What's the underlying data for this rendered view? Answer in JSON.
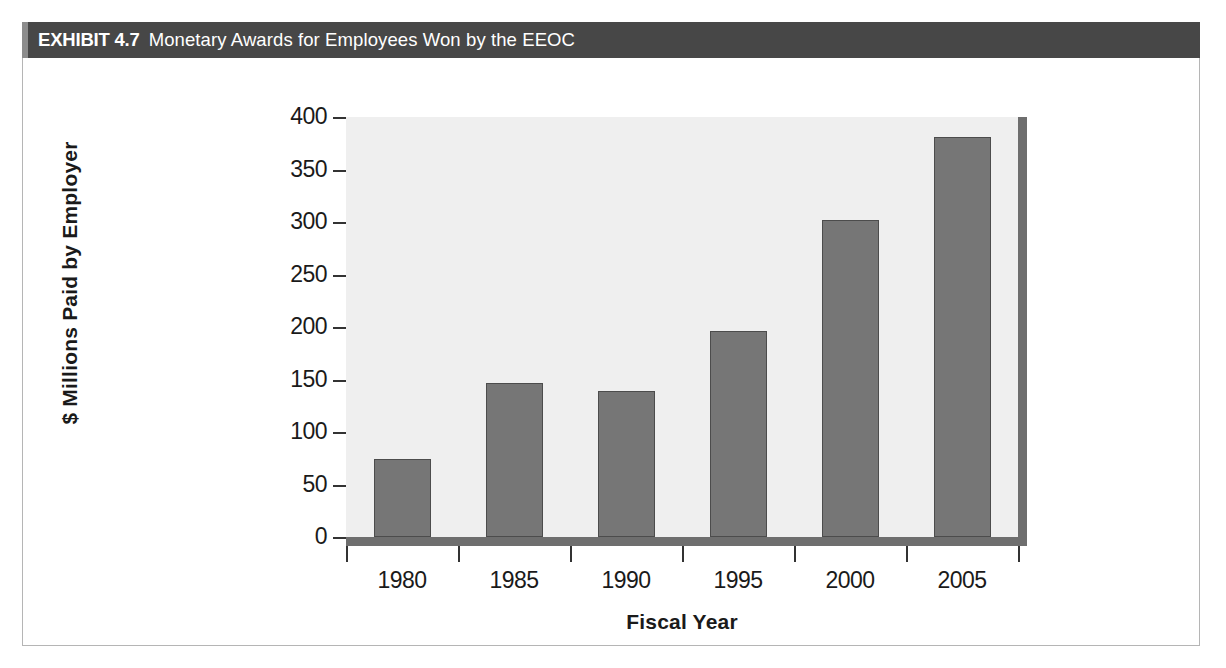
{
  "exhibit": {
    "label": "EXHIBIT 4.7",
    "title": "Monetary Awards for Employees Won by the EEOC",
    "header_bg": "#474747",
    "header_accent": "#8c8c8c",
    "header_text_color": "#ffffff"
  },
  "chart_data": {
    "type": "bar",
    "title": "Monetary Awards for Employees Won by the EEOC",
    "categories": [
      "1980",
      "1985",
      "1990",
      "1995",
      "2000",
      "2005"
    ],
    "values": [
      74,
      147,
      139,
      196,
      302,
      381
    ],
    "xlabel": "Fiscal Year",
    "ylabel": "$ Millions Paid by Employer",
    "ylim": [
      0,
      400
    ],
    "yticks": [
      "0",
      "50",
      "100",
      "150",
      "200",
      "250",
      "300",
      "350",
      "400"
    ],
    "ytick_values": [
      0,
      50,
      100,
      150,
      200,
      250,
      300,
      350,
      400
    ],
    "grid": false,
    "legend": false,
    "bar_fill_color": "#767676",
    "bar_border_color": "#4c4c4c",
    "plot_bg_color": "#efefef",
    "axis_color": "#6e6e6e"
  }
}
